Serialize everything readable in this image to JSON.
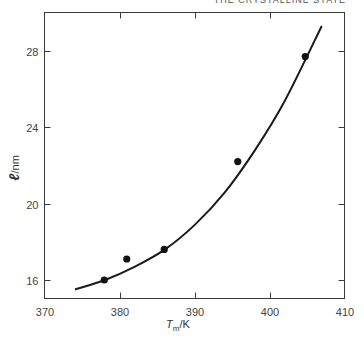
{
  "page": {
    "running_header": "THE CRYSTALLINE STATE"
  },
  "chart_data": {
    "type": "scatter",
    "title": "",
    "xlabel": "T_m/K",
    "xlabel_main": "T",
    "xlabel_sub": "m",
    "xlabel_unit": "/K",
    "ylabel": "ℓ/nm",
    "ylabel_main": "ℓ",
    "ylabel_unit": "/nm",
    "xlim": [
      370,
      410
    ],
    "ylim": [
      14.5,
      29.5
    ],
    "xticks": [
      370,
      380,
      390,
      400,
      410
    ],
    "yticks": [
      16,
      20,
      24,
      28
    ],
    "grid": false,
    "legend": null,
    "series": [
      {
        "name": "measured",
        "marker": "filled-circle",
        "x": [
          377.9,
          380.9,
          385.9,
          395.7,
          404.7
        ],
        "y": [
          16.0,
          17.1,
          17.6,
          22.2,
          27.7
        ]
      },
      {
        "name": "fitted curve",
        "style": "line",
        "x": [
          374.0,
          378.0,
          382.0,
          386.0,
          390.0,
          394.0,
          398.0,
          402.0,
          406.9
        ],
        "y": [
          15.5,
          16.0,
          16.7,
          17.6,
          18.9,
          20.6,
          22.8,
          25.4,
          29.3
        ]
      }
    ]
  }
}
